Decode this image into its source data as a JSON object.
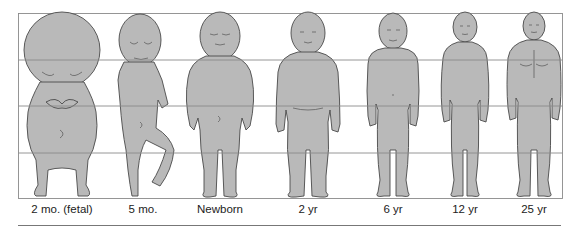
{
  "figure": {
    "grid": {
      "rows": 4,
      "frame_color": "#8a8a8a",
      "body_fill": "#b9b9b9",
      "outline": "#4a4a4a"
    },
    "stages": [
      {
        "label": "2 mo. (fetal)",
        "cx": 62
      },
      {
        "label": "5 mo.",
        "cx": 143
      },
      {
        "label": "Newborn",
        "cx": 220
      },
      {
        "label": "2 yr",
        "cx": 308
      },
      {
        "label": "6 yr",
        "cx": 393
      },
      {
        "label": "12 yr",
        "cx": 465
      },
      {
        "label": "25 yr",
        "cx": 534
      }
    ]
  }
}
